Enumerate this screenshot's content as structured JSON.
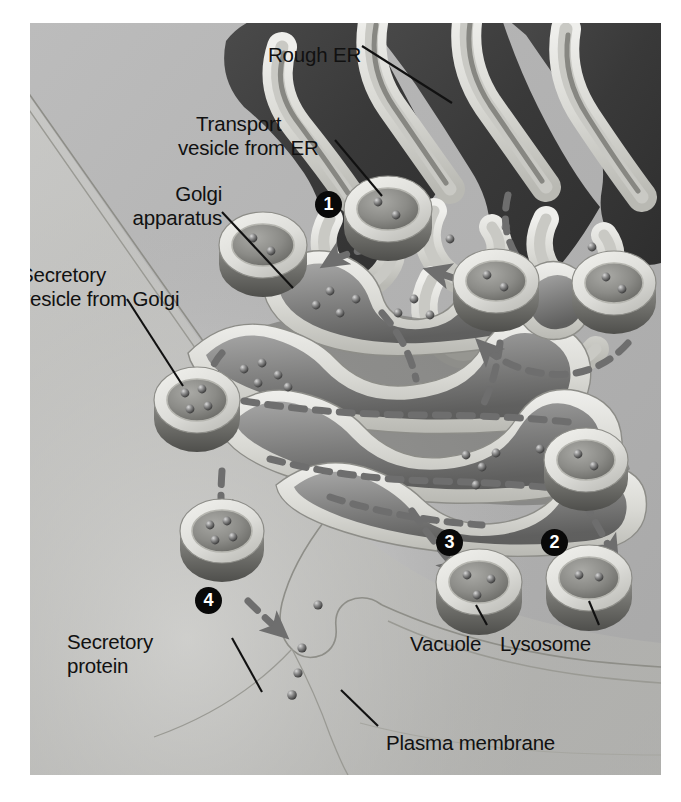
{
  "figure": {
    "background_color": "#b4b4b4",
    "label_color": "#111111",
    "badge_color": "#090909",
    "badge_text_color": "#ffffff",
    "arrow_color": "#6b6b6b",
    "membrane_color": "#d8d8d4",
    "lumen_dark_color": "#4a4a4a",
    "er_dark_color": "#3c3c3c"
  },
  "labels": [
    {
      "id": "rough-er",
      "text": "Rough ER",
      "x": 268,
      "y": 43,
      "align": "left"
    },
    {
      "id": "transport-vesicle-1",
      "text": "Transport",
      "x": 196,
      "y": 112,
      "align": "left"
    },
    {
      "id": "transport-vesicle-2",
      "text": "vesicle from ER",
      "x": 178,
      "y": 136,
      "align": "left"
    },
    {
      "id": "golgi-1",
      "text": "Golgi",
      "x": 112,
      "y": 182,
      "align": "left"
    },
    {
      "id": "golgi-2",
      "text": "apparatus",
      "x": 112,
      "y": 206,
      "align": "left"
    },
    {
      "id": "secretory-vesicle-1",
      "text": "Secretory",
      "x": 20,
      "y": 263,
      "align": "left"
    },
    {
      "id": "secretory-vesicle-2",
      "text": "vesicle from Golgi",
      "x": 20,
      "y": 287,
      "align": "left"
    },
    {
      "id": "secretory-protein-1",
      "text": "Secretory",
      "x": 67,
      "y": 630,
      "align": "left"
    },
    {
      "id": "secretory-protein-2",
      "text": "protein",
      "x": 67,
      "y": 654,
      "align": "left"
    },
    {
      "id": "vacuole",
      "text": "Vacuole",
      "x": 410,
      "y": 632,
      "align": "left"
    },
    {
      "id": "lysosome",
      "text": "Lysosome",
      "x": 500,
      "y": 632,
      "align": "left"
    },
    {
      "id": "plasma-membrane",
      "text": "Plasma membrane",
      "x": 386,
      "y": 731,
      "align": "left"
    }
  ],
  "step_badges": [
    {
      "id": "step-1",
      "number": "1",
      "x": 315,
      "y": 191,
      "describes": "transport vesicle buds from rough ER and fuses with Golgi"
    },
    {
      "id": "step-2",
      "number": "2",
      "x": 541,
      "y": 529,
      "describes": "vesicle leaves Golgi and becomes a lysosome"
    },
    {
      "id": "step-3",
      "number": "3",
      "x": 436,
      "y": 529,
      "describes": "vesicle leaves Golgi and becomes a vacuole"
    },
    {
      "id": "step-4",
      "number": "4",
      "x": 195,
      "y": 587,
      "describes": "secretory vesicle fuses with plasma membrane and releases protein"
    }
  ],
  "organelles": [
    {
      "id": "rough-er",
      "name": "Rough endoplasmic reticulum"
    },
    {
      "id": "golgi-apparatus",
      "name": "Golgi apparatus"
    },
    {
      "id": "plasma-membrane",
      "name": "Plasma membrane"
    },
    {
      "id": "vacuole",
      "name": "Vacuole"
    },
    {
      "id": "lysosome",
      "name": "Lysosome"
    }
  ],
  "vesicles": [
    {
      "id": "vesicle-er-a",
      "cx": 388,
      "cy": 216,
      "rx": 44,
      "ry": 33,
      "protein_dots": 2,
      "role": "transport vesicle from ER"
    },
    {
      "id": "vesicle-er-b",
      "cx": 496,
      "cy": 288,
      "rx": 43,
      "ry": 32,
      "protein_dots": 2,
      "role": "transport vesicle from ER"
    },
    {
      "id": "vesicle-er-c",
      "cx": 615,
      "cy": 290,
      "rx": 42,
      "ry": 32,
      "protein_dots": 2,
      "role": "transport vesicle from ER"
    },
    {
      "id": "vesicle-golgi-cis",
      "cx": 263,
      "cy": 252,
      "rx": 44,
      "ry": 33,
      "protein_dots": 2,
      "role": "vesicle entering Golgi"
    },
    {
      "id": "vesicle-golgi-out",
      "cx": 197,
      "cy": 407,
      "rx": 43,
      "ry": 33,
      "protein_dots": 4,
      "role": "secretory vesicle from Golgi"
    },
    {
      "id": "vesicle-secretory",
      "cx": 222,
      "cy": 538,
      "rx": 42,
      "ry": 32,
      "protein_dots": 4,
      "role": "secretory vesicle approaching membrane"
    },
    {
      "id": "vesicle-lyso-src",
      "cx": 587,
      "cy": 467,
      "rx": 42,
      "ry": 32,
      "protein_dots": 2,
      "role": "vesicle budding toward lysosome"
    },
    {
      "id": "vacuole",
      "cx": 479,
      "cy": 589,
      "rx": 43,
      "ry": 33,
      "protein_dots": 3,
      "role": "vacuole"
    },
    {
      "id": "lysosome",
      "cx": 589,
      "cy": 585,
      "rx": 43,
      "ry": 33,
      "protein_dots": 2,
      "role": "lysosome"
    }
  ],
  "arrows": [
    {
      "id": "arrow-er-to-golgi-far",
      "from": "rough-er",
      "to": "vesicle-er-b",
      "style": "dashed"
    },
    {
      "id": "arrow-er-to-golgi-mid",
      "from": "vesicle-er-b",
      "to": "vesicle-er-a",
      "style": "dashed"
    },
    {
      "id": "arrow-vesicle-to-golgi",
      "from": "vesicle-er-a",
      "to": "golgi-apparatus",
      "style": "dashed"
    },
    {
      "id": "arrow-golgi-to-vesicle",
      "from": "golgi-apparatus",
      "to": "vesicle-golgi-out",
      "style": "dashed"
    },
    {
      "id": "arrow-vesicle-down",
      "from": "vesicle-golgi-out",
      "to": "vesicle-secretory",
      "style": "dashed"
    },
    {
      "id": "arrow-to-membrane",
      "from": "vesicle-secretory",
      "to": "plasma-membrane",
      "style": "dashed"
    },
    {
      "id": "arrow-to-vacuole",
      "from": "golgi-apparatus",
      "to": "vacuole",
      "style": "dashed"
    },
    {
      "id": "arrow-to-lysosome",
      "from": "vesicle-lyso-src",
      "to": "lysosome",
      "style": "dashed"
    }
  ],
  "leader_lines": [
    {
      "id": "leader-rough-er",
      "from_label": "rough-er",
      "x1": 362,
      "y1": 46,
      "x2": 452,
      "y2": 103
    },
    {
      "id": "leader-transport-vesicle",
      "from_label": "transport-vesicle-2",
      "x1": 335,
      "y1": 140,
      "x2": 382,
      "y2": 196
    },
    {
      "id": "leader-golgi",
      "from_label": "golgi-2",
      "x1": 222,
      "y1": 212,
      "x2": 293,
      "y2": 288
    },
    {
      "id": "leader-secretory-vesicle",
      "from_label": "secretory-vesicle-2",
      "x1": 127,
      "y1": 299,
      "x2": 183,
      "y2": 386
    },
    {
      "id": "leader-secretory-protein",
      "from_label": "secretory-protein-1",
      "x1": 232,
      "y1": 638,
      "x2": 262,
      "y2": 692
    },
    {
      "id": "leader-vacuole",
      "from_label": "vacuole",
      "x1": 487,
      "y1": 625,
      "x2": 476,
      "y2": 605
    },
    {
      "id": "leader-lysosome",
      "from_label": "lysosome",
      "x1": 599,
      "y1": 625,
      "x2": 589,
      "y2": 601
    },
    {
      "id": "leader-plasma-membrane",
      "from_label": "plasma-membrane",
      "x1": 378,
      "y1": 726,
      "x2": 341,
      "y2": 690
    }
  ]
}
